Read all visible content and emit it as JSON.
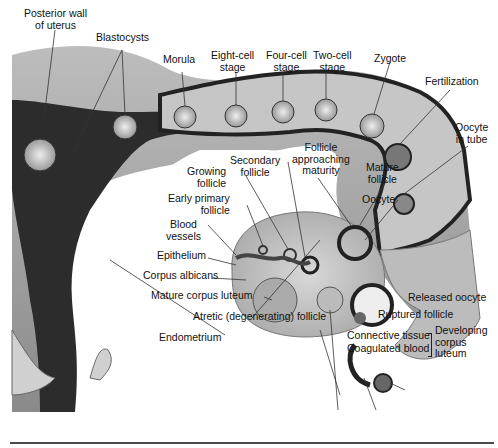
{
  "figure": {
    "type": "anatomical diagram"
  },
  "labels": {
    "posterior_wall": [
      "Posterior wall",
      "of uterus"
    ],
    "blastocysts": "Blastocysts",
    "morula": "Morula",
    "eight_cell": [
      "Eight-cell",
      "stage"
    ],
    "four_cell": [
      "Four-cell",
      "stage"
    ],
    "two_cell": [
      "Two-cell",
      "stage"
    ],
    "zygote": "Zygote",
    "fertilization": "Fertilization",
    "oocyte_in_tube": [
      "Oocyte",
      "in tube"
    ],
    "follicle_approaching": [
      "Follicle",
      "approaching",
      "maturity"
    ],
    "secondary_follicle": [
      "Secondary",
      "follicle"
    ],
    "growing_follicle": [
      "Growing",
      "follicle"
    ],
    "mature_follicle": [
      "Mature",
      "follicle"
    ],
    "oocyte": "Oocyte",
    "early_primary": [
      "Early primary",
      "follicle"
    ],
    "blood_vessels": [
      "Blood",
      "vessels"
    ],
    "epithelium": "Epithelium",
    "corpus_albicans": "Corpus albicans",
    "mature_corpus_luteum": "Mature corpus luteum",
    "atretic_follicle": "Atretic (degenerating) follicle",
    "endometrium": "Endometrium",
    "released_oocyte": "Released oocyte",
    "ruptured_follicle": "Ruptured follicle",
    "connective_tissue": "Connective tissue",
    "coagulated_blood": "Coagulated blood",
    "developing_corpus_luteum": [
      "Developing",
      "corpus",
      "luteum"
    ]
  }
}
